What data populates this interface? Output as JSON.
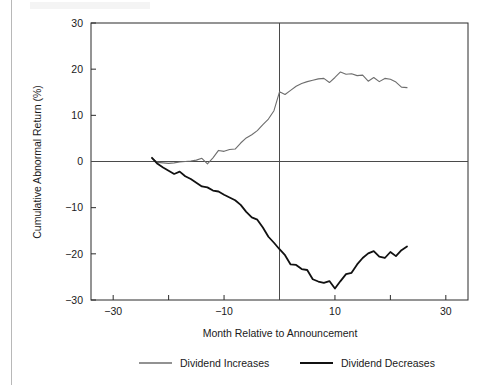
{
  "chart_data": {
    "type": "line",
    "title": "",
    "xlabel": "Month Relative to Announcement",
    "ylabel": "Cumulative Abnormal Return (%)",
    "xlim": [
      -34,
      34
    ],
    "ylim": [
      -30,
      30
    ],
    "xticks": [
      -30,
      -20,
      -10,
      0,
      10,
      20,
      30
    ],
    "xtick_labels": [
      "-30",
      "",
      "-10",
      "",
      "10",
      "",
      "30"
    ],
    "yticks": [
      -30,
      -20,
      -10,
      0,
      10,
      20,
      30
    ],
    "ytick_labels": [
      "-30",
      "-20",
      "-10",
      "0",
      "10",
      "20",
      "30"
    ],
    "grid": false,
    "legend_position": "below",
    "annotations": [
      {
        "name": "event-line",
        "type": "vline",
        "x": 0,
        "label": "Announcement month"
      },
      {
        "name": "zero-line",
        "type": "hline",
        "y": 0,
        "label": "Zero abnormal return"
      }
    ],
    "series": [
      {
        "name": "Dividend Increases",
        "color": "#6e6e6e",
        "width": 1.1,
        "x": [
          -23,
          -22,
          -21,
          -20,
          -19,
          -18,
          -17,
          -16,
          -15,
          -14,
          -13,
          -12,
          -11,
          -10,
          -9,
          -8,
          -7,
          -6,
          -5,
          -4,
          -3,
          -2,
          -1,
          0,
          1,
          2,
          3,
          4,
          5,
          6,
          7,
          8,
          9,
          10,
          11,
          12,
          13,
          14,
          15,
          16,
          17,
          18,
          19,
          20,
          21,
          22,
          23
        ],
        "y": [
          0.7,
          -0.2,
          -0.3,
          -0.4,
          -0.3,
          -0.1,
          0.0,
          0.1,
          0.3,
          0.7,
          -0.5,
          0.8,
          2.4,
          2.2,
          2.6,
          2.7,
          4.0,
          5.1,
          5.8,
          6.7,
          8.0,
          9.2,
          11.0,
          15.1,
          14.5,
          15.4,
          16.3,
          16.9,
          17.3,
          17.6,
          17.9,
          18.0,
          17.1,
          18.2,
          19.4,
          18.9,
          19.0,
          18.6,
          18.7,
          17.4,
          18.2,
          17.3,
          18.0,
          17.8,
          17.2,
          16.1,
          16.0
        ]
      },
      {
        "name": "Dividend Decreases",
        "color": "#111111",
        "width": 1.8,
        "x": [
          -23,
          -22,
          -21,
          -20,
          -19,
          -18,
          -17,
          -16,
          -15,
          -14,
          -13,
          -12,
          -11,
          -10,
          -9,
          -8,
          -7,
          -6,
          -5,
          -4,
          -3,
          -2,
          -1,
          0,
          1,
          2,
          3,
          4,
          5,
          6,
          7,
          8,
          9,
          10,
          11,
          12,
          13,
          14,
          15,
          16,
          17,
          18,
          19,
          20,
          21,
          22,
          23
        ],
        "y": [
          0.8,
          -0.5,
          -1.3,
          -2.0,
          -2.7,
          -2.2,
          -3.2,
          -3.8,
          -4.6,
          -5.4,
          -5.6,
          -6.3,
          -6.5,
          -7.2,
          -7.8,
          -8.4,
          -9.4,
          -10.9,
          -12.1,
          -12.6,
          -14.3,
          -16.3,
          -17.6,
          -19.0,
          -20.3,
          -22.3,
          -22.4,
          -23.3,
          -23.5,
          -25.5,
          -26.0,
          -26.3,
          -25.9,
          -27.5,
          -25.9,
          -24.4,
          -24.1,
          -22.3,
          -20.9,
          -19.9,
          -19.4,
          -20.6,
          -20.9,
          -19.6,
          -20.5,
          -19.2,
          -18.4
        ]
      }
    ]
  },
  "legend": {
    "items": [
      {
        "label": "Dividend Increases",
        "color": "#6e6e6e"
      },
      {
        "label": "Dividend Decreases",
        "color": "#111111"
      }
    ]
  }
}
